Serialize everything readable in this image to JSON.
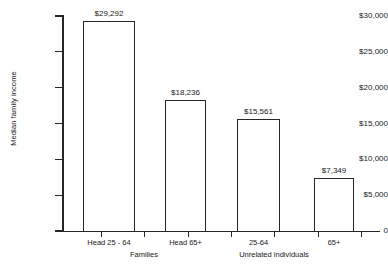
{
  "chart_data": {
    "type": "bar",
    "title": "",
    "xlabel": "",
    "ylabel": "Median family income",
    "categories": [
      "Head 25 - 64",
      "Head 65+",
      "25-64",
      "65+"
    ],
    "values": [
      29292,
      18236,
      15561,
      7349
    ],
    "value_labels": [
      "$29,292",
      "$18,236",
      "$15,561",
      "$7,349"
    ],
    "groups": [
      {
        "label": "Families",
        "categories": [
          "Head 25 - 64",
          "Head 65+"
        ]
      },
      {
        "label": "Unrelated individuals",
        "categories": [
          "25-64",
          "65+"
        ]
      }
    ],
    "ylim": [
      0,
      30000
    ],
    "ytick_values": [
      0,
      5000,
      10000,
      15000,
      20000,
      25000,
      30000
    ],
    "ytick_labels": [
      "0",
      "$5,000",
      "$10,000",
      "$15,000",
      "$20,000",
      "$25,000",
      "$30,000"
    ],
    "grid": false,
    "legend": "none",
    "bar_fill_color": "#ffffff",
    "bar_edge_color": "#262626",
    "axis_color": "#262626",
    "background_color": "#ffffff"
  }
}
